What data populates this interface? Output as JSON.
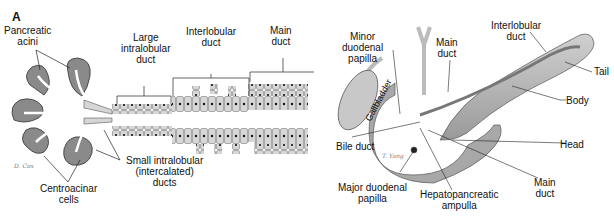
{
  "panel_label": "A",
  "left": {
    "labels": {
      "pancreatic_acini": "Pancreatic\nacini",
      "large_intralobular": "Large\nintralobular\nduct",
      "interlobular": "Interlobular\nduct",
      "main_duct": "Main\nduct",
      "small_intralobular": "Small intralobular\n(intercalated)\nducts",
      "centroacinar": "Centroacinar\ncells"
    },
    "signature": "D. Cox"
  },
  "right": {
    "labels": {
      "minor_papilla": "Minor\nduodenal\npapilla",
      "main_duct_top": "Main\nduct",
      "interlobular": "Interlobular\nduct",
      "tail": "Tail",
      "body": "Body",
      "gallbladder": "Gallbladder",
      "bile_duct": "Bile duct",
      "head": "Head",
      "major_papilla": "Major duodenal\npapilla",
      "ampulla": "Hepatopancreatic\nampulla",
      "main_duct_bottom": "Main\nduct"
    },
    "signature": "T. Yang"
  },
  "colors": {
    "acini": "#8a8a8a",
    "duct": "#d9d9d9",
    "cell_outline": "#555555",
    "nucleus": "#111111",
    "organ": "#b8b8b8",
    "organ_dark": "#8e8e8e"
  }
}
